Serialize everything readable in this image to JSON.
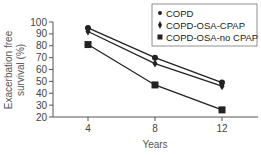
{
  "chart_data": {
    "type": "line",
    "title": "",
    "xlabel": "Years",
    "ylabel": "Exacerbation free survival (%)",
    "ylabel_lines": [
      "Exacerbation free",
      "survival (%)"
    ],
    "x": [
      4,
      8,
      12
    ],
    "x_tick_labels": [
      "4",
      "8",
      "12"
    ],
    "y_ticks": [
      20,
      30,
      40,
      50,
      60,
      70,
      80,
      90,
      100
    ],
    "ylim": [
      20,
      100
    ],
    "grid": false,
    "legend_position": "upper right",
    "series": [
      {
        "name": "COPD",
        "marker": "circle",
        "values": [
          95,
          70,
          49
        ]
      },
      {
        "name": "COPD-OSA-CPAP",
        "marker": "diamond",
        "values": [
          92,
          65,
          46
        ]
      },
      {
        "name": "COPD-OSA-no CPAP",
        "marker": "square",
        "values": [
          81,
          47,
          26
        ]
      }
    ]
  },
  "colors": {
    "line": "#222222",
    "axis": "#555555",
    "legend_border": "#777777"
  }
}
